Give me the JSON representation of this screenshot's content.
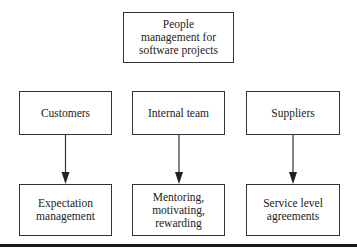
{
  "diagram": {
    "root": {
      "label": "People management for software projects",
      "lines": [
        "People",
        "management for",
        "software projects"
      ]
    },
    "categories": [
      {
        "label": "Customers",
        "outcome": {
          "label": "Expectation management",
          "lines": [
            "Expectation",
            "management"
          ]
        }
      },
      {
        "label": "Internal team",
        "outcome": {
          "label": "Mentoring, motivating, rewarding",
          "lines": [
            "Mentoring,",
            "motivating,",
            "rewarding"
          ]
        }
      },
      {
        "label": "Suppliers",
        "outcome": {
          "label": "Service level agreements",
          "lines": [
            "Service level",
            "agreements"
          ]
        }
      }
    ],
    "edges": [
      {
        "from": "Customers",
        "to": "Expectation management",
        "type": "arrow"
      },
      {
        "from": "Internal team",
        "to": "Mentoring, motivating, rewarding",
        "type": "arrow"
      },
      {
        "from": "Suppliers",
        "to": "Service level agreements",
        "type": "arrow"
      }
    ],
    "colors": {
      "stroke": "#333333",
      "text": "#222222",
      "background": "#ffffff"
    }
  }
}
